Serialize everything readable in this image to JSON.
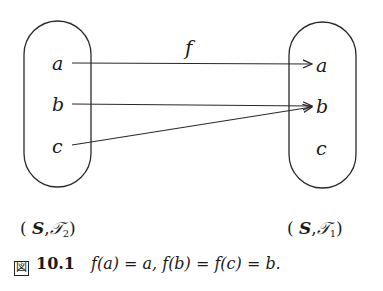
{
  "diagram": {
    "function_label": "f",
    "left_set": {
      "elements": [
        "a",
        "b",
        "c"
      ],
      "space_label": {
        "set": "S",
        "topology": "𝒯",
        "index": "2"
      }
    },
    "right_set": {
      "elements": [
        "a",
        "b",
        "c"
      ],
      "space_label": {
        "set": "S",
        "topology": "𝒯",
        "index": "1"
      }
    },
    "mappings": [
      {
        "from": "a",
        "to": "a"
      },
      {
        "from": "b",
        "to": "b"
      },
      {
        "from": "c",
        "to": "b"
      }
    ],
    "colors": {
      "stroke": "#2a2a2a",
      "text": "#1a1a1a",
      "background": "#ffffff"
    }
  },
  "caption": {
    "mark": "図",
    "number": "10.1",
    "text": "f(a) = a, f(b) = f(c) = b."
  }
}
